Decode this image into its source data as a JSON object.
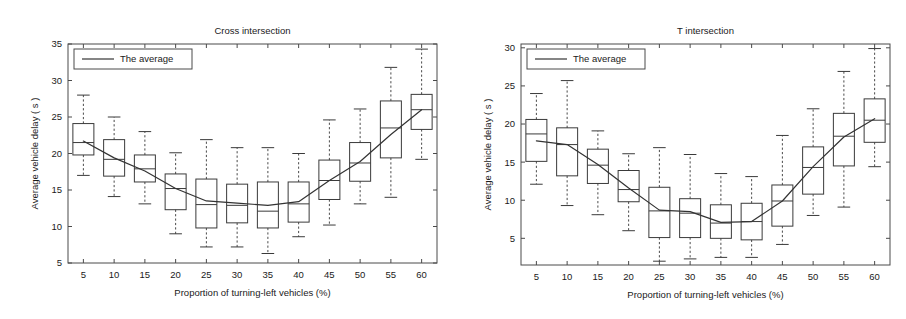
{
  "figure": {
    "width": 906,
    "height": 319,
    "background": "#ffffff",
    "line_color": "#333333",
    "axis_color": "#4a4a4a",
    "box_color": "#3a3a3a"
  },
  "chart_data": [
    {
      "type": "box",
      "panel": "left",
      "title": "Cross intersection",
      "xlabel": "Proportion of turning-left vehicles (%)",
      "ylabel": "Average vehicle delay ( s )",
      "legend": [
        "The average"
      ],
      "legend_position": "top-left",
      "grid": false,
      "categories": [
        "5",
        "10",
        "15",
        "20",
        "25",
        "30",
        "35",
        "40",
        "45",
        "50",
        "55",
        "60"
      ],
      "xlim": [
        2.5,
        62.5
      ],
      "ylim": [
        5,
        35
      ],
      "yticks": [
        5,
        10,
        15,
        20,
        25,
        30,
        35
      ],
      "xticks": [
        5,
        10,
        15,
        20,
        25,
        30,
        35,
        40,
        45,
        50,
        55,
        60
      ],
      "boxes": [
        {
          "x": 5,
          "whisker_low": 17.0,
          "q1": 19.8,
          "median": 21.5,
          "q3": 24.1,
          "whisker_high": 28.0
        },
        {
          "x": 10,
          "whisker_low": 14.1,
          "q1": 16.9,
          "median": 19.2,
          "q3": 21.9,
          "whisker_high": 25.0
        },
        {
          "x": 15,
          "whisker_low": 13.1,
          "q1": 16.1,
          "median": 17.9,
          "q3": 19.8,
          "whisker_high": 23.0
        },
        {
          "x": 20,
          "whisker_low": 9.0,
          "q1": 12.3,
          "median": 15.2,
          "q3": 17.2,
          "whisker_high": 20.1
        },
        {
          "x": 25,
          "whisker_low": 7.2,
          "q1": 9.8,
          "median": 13.0,
          "q3": 16.5,
          "whisker_high": 21.9
        },
        {
          "x": 30,
          "whisker_low": 7.2,
          "q1": 10.5,
          "median": 12.9,
          "q3": 15.8,
          "whisker_high": 20.8
        },
        {
          "x": 35,
          "whisker_low": 6.3,
          "q1": 9.8,
          "median": 12.1,
          "q3": 16.1,
          "whisker_high": 20.8
        },
        {
          "x": 40,
          "whisker_low": 8.6,
          "q1": 10.6,
          "median": 13.1,
          "q3": 16.1,
          "whisker_high": 20.0
        },
        {
          "x": 45,
          "whisker_low": 10.2,
          "q1": 13.7,
          "median": 16.3,
          "q3": 19.1,
          "whisker_high": 24.6
        },
        {
          "x": 50,
          "whisker_low": 13.1,
          "q1": 16.2,
          "median": 18.7,
          "q3": 21.5,
          "whisker_high": 26.1
        },
        {
          "x": 55,
          "whisker_low": 14.0,
          "q1": 19.4,
          "median": 23.5,
          "q3": 27.2,
          "whisker_high": 31.8
        },
        {
          "x": 60,
          "whisker_low": 19.2,
          "q1": 23.3,
          "median": 26.0,
          "q3": 28.1,
          "whisker_high": 34.3
        }
      ],
      "average_series": {
        "name": "The average",
        "x": [
          5,
          10,
          15,
          20,
          25,
          30,
          35,
          40,
          45,
          50,
          55,
          60
        ],
        "values": [
          21.7,
          19.4,
          17.6,
          15.2,
          13.5,
          13.2,
          12.9,
          13.4,
          16.3,
          18.9,
          22.6,
          26.0
        ]
      }
    },
    {
      "type": "box",
      "panel": "right",
      "title": "T intersection",
      "xlabel": "Proportion of turning-left vehicles (%)",
      "ylabel": "Average vehicle delay ( s )",
      "legend": [
        "The average"
      ],
      "legend_position": "top-left",
      "grid": false,
      "categories": [
        "5",
        "10",
        "15",
        "20",
        "25",
        "30",
        "35",
        "40",
        "45",
        "50",
        "55",
        "60"
      ],
      "xlim": [
        2.5,
        62.5
      ],
      "ylim": [
        1.5,
        30.5
      ],
      "yticks": [
        5,
        10,
        15,
        20,
        25,
        30
      ],
      "xticks": [
        5,
        10,
        15,
        20,
        25,
        30,
        35,
        40,
        45,
        50,
        55,
        60
      ],
      "boxes": [
        {
          "x": 5,
          "whisker_low": 12.1,
          "q1": 15.1,
          "median": 18.7,
          "q3": 20.6,
          "whisker_high": 24.0
        },
        {
          "x": 10,
          "whisker_low": 9.3,
          "q1": 13.2,
          "median": 17.3,
          "q3": 19.5,
          "whisker_high": 25.7
        },
        {
          "x": 15,
          "whisker_low": 8.1,
          "q1": 12.2,
          "median": 14.6,
          "q3": 16.7,
          "whisker_high": 19.1
        },
        {
          "x": 20,
          "whisker_low": 6.0,
          "q1": 9.8,
          "median": 11.4,
          "q3": 13.9,
          "whisker_high": 16.1
        },
        {
          "x": 25,
          "whisker_low": 2.0,
          "q1": 5.1,
          "median": 8.6,
          "q3": 11.7,
          "whisker_high": 16.9
        },
        {
          "x": 30,
          "whisker_low": 2.3,
          "q1": 5.1,
          "median": 8.3,
          "q3": 10.2,
          "whisker_high": 16.0
        },
        {
          "x": 35,
          "whisker_low": 2.5,
          "q1": 5.0,
          "median": 7.0,
          "q3": 9.4,
          "whisker_high": 13.5
        },
        {
          "x": 40,
          "whisker_low": 2.5,
          "q1": 4.8,
          "median": 7.2,
          "q3": 9.6,
          "whisker_high": 13.1
        },
        {
          "x": 45,
          "whisker_low": 4.2,
          "q1": 6.6,
          "median": 9.9,
          "q3": 12.0,
          "whisker_high": 18.5
        },
        {
          "x": 50,
          "whisker_low": 8.0,
          "q1": 10.8,
          "median": 14.3,
          "q3": 17.0,
          "whisker_high": 22.0
        },
        {
          "x": 55,
          "whisker_low": 9.1,
          "q1": 14.5,
          "median": 18.4,
          "q3": 21.4,
          "whisker_high": 26.9
        },
        {
          "x": 60,
          "whisker_low": 14.4,
          "q1": 17.6,
          "median": 20.5,
          "q3": 23.3,
          "whisker_high": 29.9
        }
      ],
      "average_series": {
        "name": "The average",
        "x": [
          5,
          10,
          15,
          20,
          25,
          30,
          35,
          40,
          45,
          50,
          55,
          60
        ],
        "values": [
          17.8,
          17.3,
          14.7,
          11.6,
          8.7,
          8.5,
          7.1,
          7.2,
          9.9,
          14.4,
          18.3,
          20.7
        ]
      }
    }
  ]
}
